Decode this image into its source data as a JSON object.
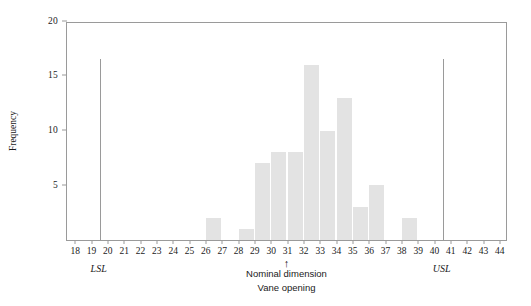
{
  "chart_data": {
    "type": "bar",
    "title": "",
    "xlabel": "Vane opening",
    "ylabel": "Frequency",
    "xlim": [
      17.5,
      44.5
    ],
    "ylim": [
      0,
      20
    ],
    "grid": false,
    "legend": "none",
    "bin_width": 1,
    "bins": [
      {
        "left": 26,
        "right": 27,
        "center": 26.5,
        "value": 2
      },
      {
        "left": 28,
        "right": 29,
        "center": 28.5,
        "value": 1
      },
      {
        "left": 29,
        "right": 30,
        "center": 29.5,
        "value": 7
      },
      {
        "left": 30,
        "right": 31,
        "center": 30.5,
        "value": 8
      },
      {
        "left": 31,
        "right": 32,
        "center": 31.5,
        "value": 8
      },
      {
        "left": 32,
        "right": 33,
        "center": 32.5,
        "value": 16
      },
      {
        "left": 33,
        "right": 34,
        "center": 33.5,
        "value": 10
      },
      {
        "left": 34,
        "right": 35,
        "center": 34.5,
        "value": 13
      },
      {
        "left": 35,
        "right": 36,
        "center": 35.5,
        "value": 3
      },
      {
        "left": 36,
        "right": 37,
        "center": 36.5,
        "value": 5
      },
      {
        "left": 38,
        "right": 39,
        "center": 38.5,
        "value": 2
      }
    ],
    "xticks": [
      18,
      19,
      20,
      21,
      22,
      23,
      24,
      25,
      26,
      27,
      28,
      29,
      30,
      31,
      32,
      33,
      34,
      35,
      36,
      37,
      38,
      39,
      40,
      41,
      42,
      43,
      44
    ],
    "yticks": [
      5,
      10,
      15,
      20
    ],
    "annotations": [
      {
        "name": "lsl",
        "label": "LSL",
        "x": 19.5,
        "type": "spec-line",
        "height": 16.5
      },
      {
        "name": "usl",
        "label": "USL",
        "x": 40.5,
        "type": "spec-line",
        "height": 16.5
      },
      {
        "name": "nominal",
        "label": "Nominal dimension",
        "x": 31.0,
        "type": "arrow"
      },
      {
        "name": "axis-caption",
        "label": "Vane opening",
        "x": 31.0,
        "type": "caption"
      }
    ],
    "colors": {
      "bar_fill": "#e3e3e3",
      "axis": "#9a9a9a",
      "text": "#1a1a1a",
      "background": "#ffffff"
    }
  }
}
